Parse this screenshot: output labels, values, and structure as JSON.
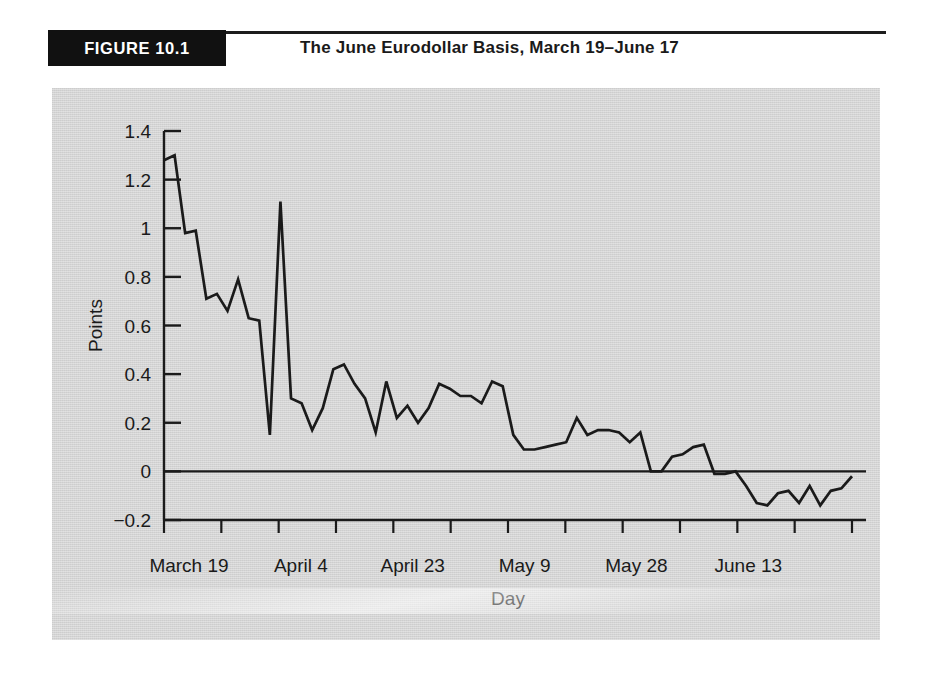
{
  "figure": {
    "banner_label": "FIGURE 10.1",
    "title": "The June Eurodollar Basis, March 19–June 17"
  },
  "chart_data": {
    "type": "line",
    "title": "The June Eurodollar Basis, March 19–June 17",
    "xlabel": "Day",
    "ylabel": "Points",
    "grid": false,
    "legend": "none",
    "line_color": "#1a1a1a",
    "panel_color": "#d4d4d4",
    "ylim": [
      -0.2,
      1.4
    ],
    "yticks": [
      -0.2,
      0,
      0.2,
      0.4,
      0.6,
      0.8,
      1.0,
      1.2,
      1.4
    ],
    "ytick_labels": [
      "−0.2",
      "0",
      "0.2",
      "0.4",
      "0.6",
      "0.8",
      "1",
      "1.2",
      "1.4"
    ],
    "xtick_labels": [
      "March 19",
      "April 4",
      "April 23",
      "May 9",
      "May 28",
      "June 13"
    ],
    "xtick_positions": [
      0,
      12,
      26,
      38,
      52,
      64
    ],
    "x_minor_tick_count": 13,
    "n_points": 66,
    "zero_line": 0,
    "values": [
      1.28,
      1.3,
      0.98,
      0.99,
      0.71,
      0.73,
      0.66,
      0.79,
      0.63,
      0.62,
      0.15,
      1.11,
      0.3,
      0.28,
      0.17,
      0.26,
      0.42,
      0.44,
      0.36,
      0.3,
      0.16,
      0.37,
      0.22,
      0.27,
      0.2,
      0.26,
      0.36,
      0.34,
      0.31,
      0.31,
      0.28,
      0.37,
      0.35,
      0.15,
      0.09,
      0.09,
      0.1,
      0.11,
      0.12,
      0.22,
      0.15,
      0.17,
      0.17,
      0.16,
      0.12,
      0.16,
      0.0,
      0.0,
      0.06,
      0.07,
      0.1,
      0.11,
      -0.01,
      -0.01,
      0.0,
      -0.06,
      -0.13,
      -0.14,
      -0.09,
      -0.08,
      -0.13,
      -0.06,
      -0.14,
      -0.08,
      -0.07,
      -0.02
    ]
  }
}
